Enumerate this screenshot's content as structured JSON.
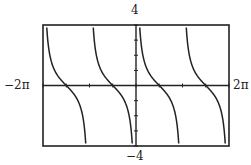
{
  "chart_data": {
    "type": "line",
    "title": "",
    "function": "cot(x)",
    "xlabel": "",
    "ylabel": "",
    "xlim": [
      "-2π",
      "2π"
    ],
    "xlim_numeric": [
      -6.2832,
      6.2832
    ],
    "ylim": [
      -4,
      4
    ],
    "tick_labels": {
      "y_max": "4",
      "y_min": "−4",
      "x_min": "−2π",
      "x_max": "2π"
    },
    "x_ticks_every": "π/2",
    "y_ticks_every": 1,
    "asymptotes": [
      "-2π",
      "-π",
      "0",
      "π",
      "2π"
    ],
    "zeros": [
      "-3π/2",
      "-π/2",
      "π/2",
      "3π/2"
    ],
    "grid": false,
    "legend": null,
    "colors": {
      "curve": "#222222",
      "frame": "#222222",
      "axes": "#222222"
    }
  }
}
